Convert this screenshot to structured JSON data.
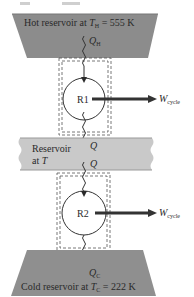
{
  "diagram": {
    "hot_reservoir": {
      "label_prefix": "Hot reservoir at ",
      "temp_symbol": "T",
      "temp_subscript": "H",
      "temp_value": " = 555 K",
      "color": "#8c8c8c"
    },
    "middle_reservoir": {
      "line1": "Reservoir",
      "line2_prefix": "at ",
      "temp_symbol": "T",
      "color": "#c9c9c9"
    },
    "cold_reservoir": {
      "label_prefix": "Cold reservoir at ",
      "temp_symbol": "T",
      "temp_subscript": "C",
      "temp_value": " = 222 K",
      "color": "#8f8f8f"
    },
    "engine1": {
      "label": "R1"
    },
    "engine2": {
      "label": "R2"
    },
    "heat_flows": {
      "q_hot": {
        "symbol": "Q",
        "subscript": "H"
      },
      "q_mid_out": {
        "symbol": "Q"
      },
      "q_mid_in": {
        "symbol": "Q"
      },
      "q_cold": {
        "symbol": "Q",
        "subscript": "C"
      }
    },
    "work_outputs": {
      "w1": {
        "symbol": "W",
        "subscript": "cycle"
      },
      "w2": {
        "symbol": "W",
        "subscript": "cycle"
      }
    }
  }
}
